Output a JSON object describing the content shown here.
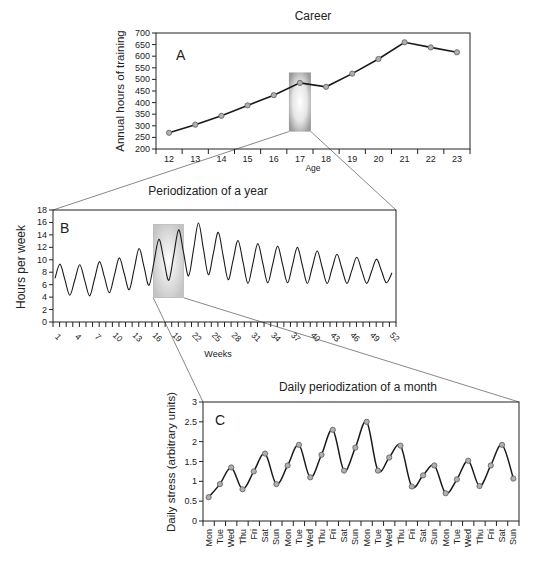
{
  "chart_data": [
    {
      "id": "A",
      "type": "line",
      "title": "Career",
      "panel_label": "A",
      "xlabel": "Age",
      "ylabel": "Annual hours of training",
      "categories": [
        12,
        13,
        14,
        15,
        16,
        17,
        18,
        19,
        20,
        21,
        22,
        23
      ],
      "values": [
        270,
        305,
        343,
        388,
        432,
        485,
        468,
        525,
        588,
        660,
        638,
        617
      ],
      "ylim": [
        200,
        700
      ],
      "yticks": [
        200,
        250,
        300,
        350,
        400,
        450,
        500,
        550,
        600,
        650,
        700
      ],
      "highlight": {
        "x": 17,
        "y_range": [
          275,
          530
        ],
        "color": "#a0a0a0"
      },
      "grid": false
    },
    {
      "id": "B",
      "type": "line",
      "title": "Periodization of a year",
      "panel_label": "B",
      "xlabel": "Weeks",
      "ylabel": "Hours per week",
      "x_tick_labels": [
        1,
        4,
        7,
        10,
        13,
        16,
        19,
        22,
        25,
        28,
        31,
        34,
        37,
        40,
        43,
        46,
        49,
        52
      ],
      "ylim": [
        0,
        18
      ],
      "yticks": [
        0,
        2,
        4,
        6,
        8,
        10,
        12,
        14,
        16,
        18
      ],
      "cycle_peaks": [
        9.3,
        9.2,
        9.7,
        10.3,
        11.8,
        13.3,
        14.8,
        15.9,
        14.4,
        13.1,
        12.6,
        12.2,
        12.0,
        11.4,
        10.9,
        10.4,
        10.1
      ],
      "cycle_troughs": [
        4.3,
        4.2,
        4.7,
        5.2,
        5.9,
        6.7,
        7.4,
        7.6,
        6.8,
        6.2,
        6.3,
        6.3,
        6.2,
        6.2,
        6.2,
        6.2,
        6.3
      ],
      "start_value": 7.0,
      "end_value": 7.9,
      "highlight": {
        "week_range": [
          16,
          20
        ],
        "y_range": [
          3.9,
          15.7
        ],
        "color": "#c8c8c8"
      },
      "grid": false
    },
    {
      "id": "C",
      "type": "line",
      "title": "Daily periodization of a month",
      "panel_label": "C",
      "xlabel": "",
      "ylabel": "Daily stress (arbitrary units)",
      "categories": [
        "Mon",
        "Tue",
        "Wed",
        "Thu",
        "Fri",
        "Sat",
        "Sun",
        "Mon",
        "Tue",
        "Wed",
        "Thu",
        "Fri",
        "Sat",
        "Sun",
        "Mon",
        "Tue",
        "Wed",
        "Thu",
        "Fri",
        "Sat",
        "Sun",
        "Mon",
        "Tue",
        "Wed",
        "Thu",
        "Fri",
        "Sat",
        "Sun"
      ],
      "values": [
        0.6,
        0.93,
        1.35,
        0.8,
        1.25,
        1.7,
        0.93,
        1.4,
        1.92,
        1.1,
        1.67,
        2.3,
        1.27,
        1.85,
        2.5,
        1.27,
        1.6,
        1.9,
        0.87,
        1.15,
        1.4,
        0.7,
        1.05,
        1.52,
        0.88,
        1.4,
        1.92,
        1.07
      ],
      "ylim": [
        0,
        3
      ],
      "yticks": [
        0,
        0.5,
        1,
        1.5,
        2,
        2.5,
        3
      ],
      "grid": false
    }
  ],
  "colors": {
    "line": "#1a1a1a",
    "marker_fill": "#b0b0b0",
    "marker_stroke": "#666666",
    "connector": "#555555"
  }
}
